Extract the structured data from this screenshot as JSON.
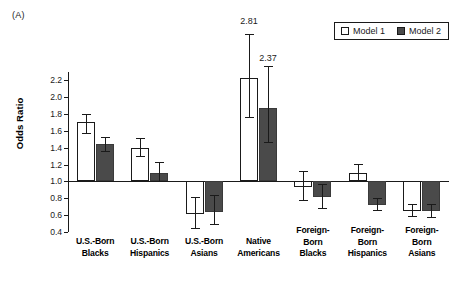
{
  "panel": {
    "label": "(A)"
  },
  "legend": {
    "position": "top-right",
    "entries": [
      {
        "name": "Model 1",
        "style": "open",
        "color": "#ffffff"
      },
      {
        "name": "Model 2",
        "style": "filled",
        "color": "#4a4a4a"
      }
    ]
  },
  "chart_data": {
    "type": "bar",
    "title": "",
    "subtitle": "",
    "xlabel": "",
    "ylabel": "Odds Ratio",
    "ylim": [
      0.4,
      2.3
    ],
    "yticks": [
      0.4,
      0.6,
      0.8,
      1.0,
      1.2,
      1.4,
      1.6,
      1.8,
      2.0,
      2.2
    ],
    "ytick_labels": [
      "0.4",
      "0.6",
      "0.8",
      "1.0",
      "1.2",
      "1.4",
      "1.6",
      "1.8",
      "2.0",
      "2.2"
    ],
    "reference_line": 1.0,
    "grid": false,
    "legend_position": "top-right",
    "error_bars": "95% CI",
    "categories": [
      "U.S.-Born Blacks",
      "U.S.-Born Hispanics",
      "U.S.-Born Asians",
      "Native Americans",
      "Foreign-Born Blacks",
      "Foreign-Born Hispanics",
      "Foreign-Born Asians"
    ],
    "category_label_lines": [
      [
        "U.S.-Born",
        "Blacks"
      ],
      [
        "U.S.-Born",
        "Hispanics"
      ],
      [
        "U.S.-Born",
        "Asians"
      ],
      [
        "Native",
        "Americans"
      ],
      [
        "Foreign-",
        "Born",
        "Blacks"
      ],
      [
        "Foreign-",
        "Born",
        "Hispanics"
      ],
      [
        "Foreign-",
        "Born",
        "Asians"
      ]
    ],
    "series": [
      {
        "name": "Model 1",
        "color": "#ffffff",
        "values": [
          1.71,
          1.4,
          0.61,
          2.23,
          0.93,
          1.1,
          0.65
        ],
        "ci_low": [
          1.58,
          1.3,
          0.45,
          1.76,
          0.78,
          1.0,
          0.59
        ],
        "ci_high": [
          1.8,
          1.52,
          0.81,
          2.81,
          1.12,
          1.21,
          0.73
        ]
      },
      {
        "name": "Model 2",
        "color": "#4a4a4a",
        "values": [
          1.44,
          1.1,
          0.64,
          1.87,
          0.81,
          0.72,
          0.65
        ],
        "ci_low": [
          1.36,
          1.0,
          0.49,
          1.47,
          0.68,
          0.66,
          0.58
        ],
        "ci_high": [
          1.53,
          1.23,
          0.84,
          2.37,
          0.97,
          0.8,
          0.73
        ]
      }
    ],
    "annotations": [
      {
        "text": "2.81",
        "category": "Native Americans",
        "series": "Model 1",
        "value": 2.81
      },
      {
        "text": "2.37",
        "category": "Native Americans",
        "series": "Model 2",
        "value": 2.37
      }
    ]
  }
}
